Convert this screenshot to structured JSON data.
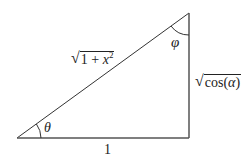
{
  "diagram": {
    "type": "right-triangle",
    "vertices": {
      "bottom_left": {
        "x": 17,
        "y": 138
      },
      "bottom_right": {
        "x": 189,
        "y": 138
      },
      "top_right": {
        "x": 189,
        "y": 13
      }
    },
    "stroke_color": "#333333",
    "labels": {
      "hypotenuse": {
        "radicand_prefix": "1 + ",
        "variable": "x",
        "exponent": "2"
      },
      "vertical_side": {
        "func": "cos(",
        "variable": "α",
        "close": ")"
      },
      "base": "1",
      "angle_bottom_left": "θ",
      "angle_top_right": "φ"
    }
  }
}
